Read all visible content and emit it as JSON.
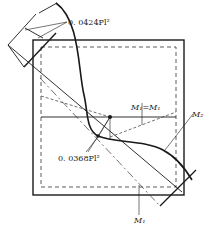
{
  "figure": {
    "type": "bending moment diagram on square plate",
    "labels": {
      "top_moment": "0. 0424Pl²",
      "center_moment": "0. 0368Pl²",
      "equal_moments": "M₁=M₁",
      "m2_label": "M₂",
      "m1_label": "M₁"
    },
    "colors": {
      "line": "#1a1a1a",
      "dashed": "#333333",
      "background": "#ffffff"
    }
  }
}
